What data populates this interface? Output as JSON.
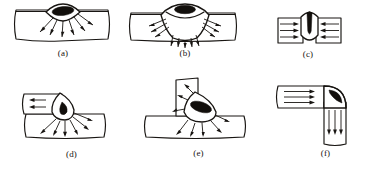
{
  "figure": {
    "background_color": "#ffffff",
    "ink_color": "#181512",
    "weld_core_color": "#120f0c",
    "panel_count": 6
  },
  "panels": [
    {
      "id": "a",
      "label": "(a)",
      "joint_type": "bead-on-plate weld",
      "plate_orientation": "horizontal single plate",
      "bead_shape": "lens / eye shaped surface bead",
      "core_shape": "black elongated ellipse",
      "arrow_count": 6,
      "arrow_direction": "radiating downward into plate",
      "penetration": "partial"
    },
    {
      "id": "b",
      "label": "(b)",
      "joint_type": "full-penetration bead-on-plate weld",
      "plate_orientation": "horizontal single plate",
      "bead_shape": "wide fan shaped bead through thickness",
      "core_shape": "black elongated ellipse at crown",
      "arrow_count": 11,
      "arrow_direction": "radiating outward and downward through plate",
      "penetration": "full"
    },
    {
      "id": "c",
      "label": "(c)",
      "joint_type": "butt joint weld",
      "plate_orientation": "horizontal plates edge to edge",
      "bead_shape": "shield shaped vertical bead",
      "core_shape": "black flame / teardrop column",
      "arrow_count": 6,
      "arrow_direction": "horizontal inward from both sides",
      "penetration": "full"
    },
    {
      "id": "d",
      "label": "(d)",
      "joint_type": "lap joint fillet weld",
      "plate_orientation": "upper plate overlapping lower plate",
      "bead_shape": "teardrop fillet at plate edge",
      "core_shape": "black droplet",
      "arrow_count": 8,
      "arrow_direction": "horizontal in top plate, radiating down in base plate",
      "penetration": "partial"
    },
    {
      "id": "e",
      "label": "(e)",
      "joint_type": "T joint fillet weld",
      "plate_orientation": "vertical plate on horizontal base plate",
      "bead_shape": "rounded triangular fillet",
      "core_shape": "black elongated ellipse",
      "arrow_count": 8,
      "arrow_direction": "radiating into vertical web and base plate",
      "penetration": "partial"
    },
    {
      "id": "f",
      "label": "(f)",
      "joint_type": "corner joint weld",
      "plate_orientation": "L shaped corner, horizontal arm and vertical arm",
      "bead_shape": "quarter round corner bead",
      "core_shape": "black crescent",
      "arrow_count": 7,
      "arrow_direction": "horizontal in top arm, downward in vertical arm",
      "penetration": "partial"
    }
  ]
}
